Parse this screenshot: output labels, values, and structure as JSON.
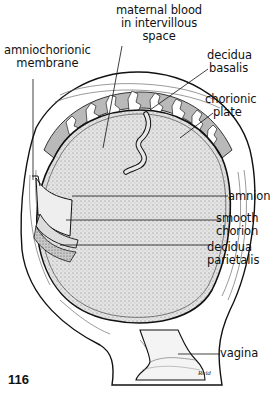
{
  "figure": {
    "number": "116",
    "signature": "Reid"
  },
  "labels": {
    "maternal_blood": [
      "maternal blood",
      "in intervillous",
      "space"
    ],
    "amniochorionic": [
      "amniochorionic",
      "membrane"
    ],
    "decidua_basalis": [
      "decidua",
      "basalis"
    ],
    "chorionic_plate": [
      "chorionic",
      "plate"
    ],
    "amnion": [
      "amnion"
    ],
    "smooth_chorion": [
      "smooth",
      "chorion"
    ],
    "decidua_parietalis": [
      "decidua",
      "parietalis"
    ],
    "vagina": [
      "vagina"
    ]
  },
  "colors": {
    "ink": "#111111",
    "shade": "#bdbdbd",
    "light_shade": "#dcdcdc",
    "background": "#ffffff"
  }
}
